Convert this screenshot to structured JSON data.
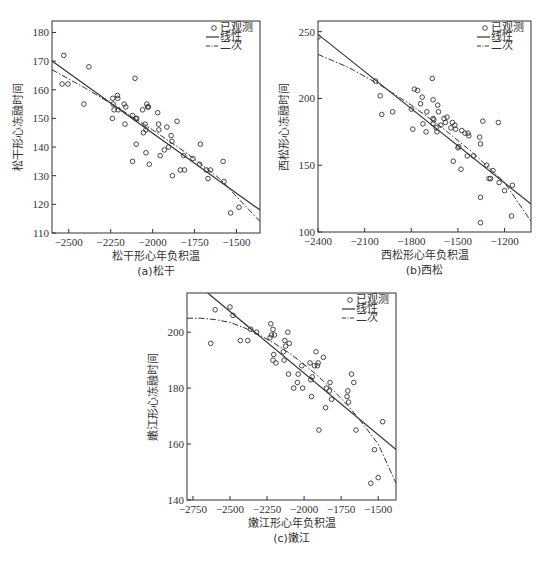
{
  "chart_data": [
    {
      "id": "a",
      "type": "scatter",
      "caption": "(a)松干",
      "xlabel": "松干形心年负积温",
      "ylabel": "松干形心冻融时间",
      "xlim": [
        -2600,
        -1360
      ],
      "ylim": [
        110,
        184
      ],
      "xticks": [
        -2500,
        -2250,
        -2000,
        -1750,
        -1500
      ],
      "yticks": [
        110,
        120,
        130,
        140,
        150,
        160,
        170,
        180
      ],
      "grid": false,
      "legend": [
        "已观测",
        "线性",
        "二次"
      ],
      "legend_position": "upper right",
      "frame": {
        "left": 52,
        "top": 21,
        "right": 260,
        "bottom": 233
      },
      "series": [
        {
          "name": "已观测",
          "kind": "points",
          "points": [
            [
              -2540,
              162
            ],
            [
              -2530,
              172
            ],
            [
              -2505,
              162
            ],
            [
              -2410,
              155
            ],
            [
              -2380,
              168
            ],
            [
              -2240,
              150
            ],
            [
              -2238,
              157
            ],
            [
              -2235,
              155
            ],
            [
              -2230,
              153
            ],
            [
              -2210,
              158
            ],
            [
              -2208,
              157
            ],
            [
              -2205,
              153
            ],
            [
              -2170,
              155
            ],
            [
              -2165,
              148
            ],
            [
              -2160,
              154
            ],
            [
              -2120,
              151
            ],
            [
              -2120,
              135
            ],
            [
              -2105,
              164
            ],
            [
              -2100,
              150
            ],
            [
              -2098,
              141
            ],
            [
              -2095,
              150
            ],
            [
              -2060,
              153
            ],
            [
              -2055,
              145
            ],
            [
              -2045,
              148
            ],
            [
              -2040,
              138
            ],
            [
              -2040,
              146
            ],
            [
              -2035,
              155
            ],
            [
              -2030,
              154
            ],
            [
              -2025,
              154
            ],
            [
              -2020,
              134
            ],
            [
              -1970,
              152
            ],
            [
              -1965,
              148
            ],
            [
              -1963,
              146
            ],
            [
              -1955,
              137
            ],
            [
              -1930,
              139
            ],
            [
              -1915,
              147
            ],
            [
              -1905,
              140
            ],
            [
              -1890,
              144
            ],
            [
              -1885,
              142
            ],
            [
              -1882,
              130
            ],
            [
              -1855,
              149
            ],
            [
              -1835,
              132
            ],
            [
              -1815,
              137
            ],
            [
              -1810,
              132
            ],
            [
              -1760,
              136
            ],
            [
              -1720,
              134
            ],
            [
              -1715,
              141
            ],
            [
              -1680,
              132
            ],
            [
              -1670,
              129
            ],
            [
              -1655,
              132
            ],
            [
              -1580,
              135
            ],
            [
              -1575,
              128
            ],
            [
              -1535,
              117
            ],
            [
              -1485,
              119
            ]
          ]
        },
        {
          "name": "线性",
          "kind": "line",
          "x": [
            -2600,
            -1360
          ],
          "y": [
            170,
            118
          ]
        },
        {
          "name": "二次",
          "kind": "curve",
          "x": [
            -2600,
            -2400,
            -2200,
            -2000,
            -1800,
            -1600,
            -1360
          ],
          "y": [
            167,
            160.5,
            153.5,
            146,
            138,
            129,
            114
          ]
        }
      ]
    },
    {
      "id": "b",
      "type": "scatter",
      "caption": "(b)西松",
      "xlabel": "西松形心年负积温",
      "ylabel": "西松形心冻融时间",
      "xlim": [
        -2400,
        -1030
      ],
      "ylim": [
        100,
        258
      ],
      "xticks": [
        -2400,
        -2100,
        -1800,
        -1500,
        -1200
      ],
      "yticks": [
        100,
        150,
        200,
        250
      ],
      "grid": false,
      "legend": [
        "已观测",
        "线性",
        "二次"
      ],
      "legend_position": "upper right",
      "frame": {
        "left": 318,
        "top": 21,
        "right": 531,
        "bottom": 232
      },
      "series": [
        {
          "name": "已观测",
          "kind": "points",
          "points": [
            [
              -2400,
              246
            ],
            [
              -2030,
              213
            ],
            [
              -2000,
              202
            ],
            [
              -1990,
              188
            ],
            [
              -1920,
              190
            ],
            [
              -1800,
              192
            ],
            [
              -1790,
              177
            ],
            [
              -1780,
              207
            ],
            [
              -1760,
              206
            ],
            [
              -1740,
              196
            ],
            [
              -1730,
              201
            ],
            [
              -1725,
              181
            ],
            [
              -1705,
              175
            ],
            [
              -1700,
              190
            ],
            [
              -1665,
              215
            ],
            [
              -1660,
              199
            ],
            [
              -1660,
              185
            ],
            [
              -1660,
              181
            ],
            [
              -1655,
              184
            ],
            [
              -1640,
              178
            ],
            [
              -1635,
              175
            ],
            [
              -1630,
              195
            ],
            [
              -1625,
              190
            ],
            [
              -1610,
              180
            ],
            [
              -1590,
              185
            ],
            [
              -1580,
              182
            ],
            [
              -1570,
              186
            ],
            [
              -1545,
              178
            ],
            [
              -1535,
              182
            ],
            [
              -1530,
              153
            ],
            [
              -1520,
              180
            ],
            [
              -1515,
              177
            ],
            [
              -1500,
              163
            ],
            [
              -1495,
              164
            ],
            [
              -1480,
              147
            ],
            [
              -1475,
              176
            ],
            [
              -1455,
              174
            ],
            [
              -1440,
              157
            ],
            [
              -1435,
              174
            ],
            [
              -1430,
              172
            ],
            [
              -1400,
              157
            ],
            [
              -1360,
              171
            ],
            [
              -1355,
              166
            ],
            [
              -1355,
              126
            ],
            [
              -1355,
              107
            ],
            [
              -1340,
              183
            ],
            [
              -1315,
              150
            ],
            [
              -1300,
              140
            ],
            [
              -1290,
              140
            ],
            [
              -1275,
              146
            ],
            [
              -1240,
              182
            ],
            [
              -1235,
              137
            ],
            [
              -1200,
              131
            ],
            [
              -1155,
              112
            ],
            [
              -1150,
              135
            ]
          ]
        },
        {
          "name": "线性",
          "kind": "line",
          "x": [
            -2400,
            -1030
          ],
          "y": [
            248,
            121
          ]
        },
        {
          "name": "二次",
          "kind": "curve",
          "x": [
            -2400,
            -2200,
            -2000,
            -1800,
            -1600,
            -1400,
            -1200,
            -1030
          ],
          "y": [
            233,
            223,
            210,
            195,
            178,
            159,
            137,
            108
          ]
        }
      ]
    },
    {
      "id": "c",
      "type": "scatter",
      "caption": "(c)嫩江",
      "xlabel": "嫩江形心年负积温",
      "ylabel": "嫩江形心冻融时间",
      "xlim": [
        -2790,
        -1380
      ],
      "ylim": [
        140,
        214
      ],
      "xticks": [
        -2750,
        -2500,
        -2250,
        -2000,
        -1750,
        -1500
      ],
      "yticks": [
        140,
        160,
        180,
        200
      ],
      "grid": false,
      "legend": [
        "已观测",
        "线性",
        "二次"
      ],
      "legend_position": "upper right",
      "frame": {
        "left": 187,
        "top": 293,
        "right": 396,
        "bottom": 500
      },
      "series": [
        {
          "name": "已观测",
          "kind": "points",
          "points": [
            [
              -2630,
              196
            ],
            [
              -2600,
              208
            ],
            [
              -2500,
              209
            ],
            [
              -2480,
              206
            ],
            [
              -2430,
              197
            ],
            [
              -2380,
              197
            ],
            [
              -2360,
              201
            ],
            [
              -2320,
              200
            ],
            [
              -2230,
              198
            ],
            [
              -2225,
              203
            ],
            [
              -2220,
              199
            ],
            [
              -2210,
              201
            ],
            [
              -2210,
              190
            ],
            [
              -2205,
              192
            ],
            [
              -2200,
              199
            ],
            [
              -2190,
              189
            ],
            [
              -2140,
              193
            ],
            [
              -2135,
              190
            ],
            [
              -2130,
              197
            ],
            [
              -2125,
              195
            ],
            [
              -2110,
              200
            ],
            [
              -2105,
              185
            ],
            [
              -2100,
              196
            ],
            [
              -2070,
              180
            ],
            [
              -2045,
              182
            ],
            [
              -2040,
              185
            ],
            [
              -2015,
              188
            ],
            [
              -2010,
              180
            ],
            [
              -1960,
              189
            ],
            [
              -1955,
              183
            ],
            [
              -1950,
              177
            ],
            [
              -1945,
              184
            ],
            [
              -1930,
              188
            ],
            [
              -1920,
              193
            ],
            [
              -1910,
              188
            ],
            [
              -1905,
              189
            ],
            [
              -1900,
              165
            ],
            [
              -1870,
              191
            ],
            [
              -1855,
              173
            ],
            [
              -1850,
              180
            ],
            [
              -1830,
              179
            ],
            [
              -1825,
              182
            ],
            [
              -1815,
              176
            ],
            [
              -1710,
              177
            ],
            [
              -1705,
              179
            ],
            [
              -1700,
              175
            ],
            [
              -1680,
              185
            ],
            [
              -1665,
              182
            ],
            [
              -1650,
              165
            ],
            [
              -1550,
              146
            ],
            [
              -1525,
              158
            ],
            [
              -1500,
              148
            ],
            [
              -1470,
              168
            ]
          ]
        },
        {
          "name": "线性",
          "kind": "line",
          "x": [
            -2650,
            -1380
          ],
          "y": [
            214,
            158
          ]
        },
        {
          "name": "二次",
          "kind": "curve",
          "x": [
            -2790,
            -2700,
            -2600,
            -2500,
            -2400,
            -2300,
            -2200,
            -2100,
            -2000,
            -1900,
            -1800,
            -1700,
            -1600,
            -1500,
            -1380
          ],
          "y": [
            205,
            205,
            204.5,
            203.5,
            201.5,
            199,
            196,
            192.5,
            188.5,
            184,
            179,
            173.5,
            167,
            160,
            146
          ]
        }
      ]
    }
  ]
}
